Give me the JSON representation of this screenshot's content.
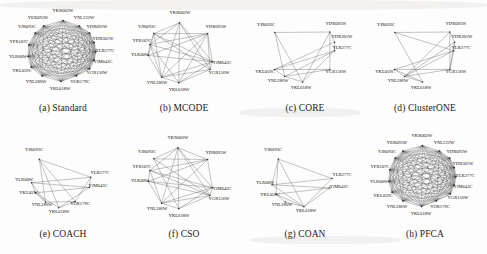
{
  "figure": {
    "type": "scientific-figure",
    "panel_count": 8,
    "columns": 4,
    "rows": 2,
    "background_color": "#fdfdfd",
    "edge_color": "#4a4a4a",
    "label_color": "#15130f"
  },
  "genes": {
    "full_set": [
      "YKR002W",
      "YER095W",
      "YNL222W",
      "YJR093C",
      "YDR095W",
      "YDR301W",
      "YPR107C",
      "YLR277C",
      "YLR00W",
      "YJM043C",
      "YKL059C",
      "YGR156W",
      "YNL286W",
      "YOR179C",
      "YKL018W"
    ],
    "core_set": [
      "YKR002W",
      "YJR093C",
      "YPR107C",
      "YLR00W",
      "YDR095W",
      "YDR301W",
      "YLR277C",
      "YJM043C",
      "YGR156W",
      "YNL286W",
      "YKL018W"
    ],
    "reduced_set": [
      "YJR093C",
      "YDR095W",
      "YDR301W",
      "YLR277C",
      "YKL059C",
      "YGR156W",
      "YNL286W",
      "YKL018W"
    ],
    "coach_set": [
      "YJR093C",
      "YLR00W",
      "YKL059C",
      "YNL286W",
      "YKL018W",
      "YLR277C",
      "YJM043C",
      "YOR179C"
    ]
  },
  "panels": [
    {
      "id": "a",
      "caption": "(a) Standard",
      "method": "Standard",
      "node_count": 15,
      "edge_density": "very-high",
      "nodes": [
        {
          "label": "YKR002W",
          "x": 61,
          "y": 12,
          "anchor": "middle"
        },
        {
          "label": "YER095W",
          "x": 36,
          "y": 19,
          "anchor": "middle"
        },
        {
          "label": "YNL222W",
          "x": 82,
          "y": 19,
          "anchor": "middle"
        },
        {
          "label": "YJR093C",
          "x": 25,
          "y": 28,
          "anchor": "middle"
        },
        {
          "label": "YDR095W",
          "x": 95,
          "y": 28,
          "anchor": "middle"
        },
        {
          "label": "YDR301W",
          "x": 101,
          "y": 40,
          "anchor": "middle"
        },
        {
          "label": "YPR107C",
          "x": 17,
          "y": 43,
          "anchor": "middle"
        },
        {
          "label": "YLR277C",
          "x": 103,
          "y": 52,
          "anchor": "middle"
        },
        {
          "label": "YLR00W",
          "x": 16,
          "y": 58,
          "anchor": "middle"
        },
        {
          "label": "YJM043C",
          "x": 101,
          "y": 63,
          "anchor": "middle"
        },
        {
          "label": "YKL059C",
          "x": 20,
          "y": 72,
          "anchor": "middle"
        },
        {
          "label": "YGR156W",
          "x": 95,
          "y": 74,
          "anchor": "middle"
        },
        {
          "label": "YNL286W",
          "x": 34,
          "y": 83,
          "anchor": "middle"
        },
        {
          "label": "YOR179C",
          "x": 78,
          "y": 83,
          "anchor": "middle"
        },
        {
          "label": "YKL018W",
          "x": 58,
          "y": 90,
          "anchor": "middle"
        }
      ]
    },
    {
      "id": "b",
      "caption": "(b) MCODE",
      "method": "MCODE",
      "node_count": 11,
      "edge_density": "high",
      "nodes": [
        {
          "label": "YKR002W",
          "x": 57,
          "y": 14,
          "anchor": "middle"
        },
        {
          "label": "YJR093C",
          "x": 24,
          "y": 28,
          "anchor": "middle"
        },
        {
          "label": "YDR095W",
          "x": 93,
          "y": 28,
          "anchor": "middle"
        },
        {
          "label": "YPR107C",
          "x": 19,
          "y": 42,
          "anchor": "middle"
        },
        {
          "label": "YLR00W",
          "x": 17,
          "y": 56,
          "anchor": "middle"
        },
        {
          "label": "YJM043C",
          "x": 99,
          "y": 64,
          "anchor": "middle"
        },
        {
          "label": "YGR156W",
          "x": 96,
          "y": 74,
          "anchor": "middle"
        },
        {
          "label": "YNL286W",
          "x": 34,
          "y": 84,
          "anchor": "middle"
        },
        {
          "label": "YKL018W",
          "x": 56,
          "y": 91,
          "anchor": "middle"
        }
      ]
    },
    {
      "id": "c",
      "caption": "(c) CORE",
      "method": "CORE",
      "node_count": 8,
      "edge_density": "medium",
      "nodes": [
        {
          "label": "YJR093C",
          "x": 22,
          "y": 26,
          "anchor": "middle"
        },
        {
          "label": "YDR095W",
          "x": 92,
          "y": 25,
          "anchor": "middle"
        },
        {
          "label": "YDR301W",
          "x": 98,
          "y": 38,
          "anchor": "middle"
        },
        {
          "label": "YLR277C",
          "x": 98,
          "y": 49,
          "anchor": "middle"
        },
        {
          "label": "YKL059C",
          "x": 21,
          "y": 73,
          "anchor": "middle"
        },
        {
          "label": "YGR156W",
          "x": 92,
          "y": 73,
          "anchor": "middle"
        },
        {
          "label": "YNL286W",
          "x": 34,
          "y": 82,
          "anchor": "middle"
        },
        {
          "label": "YKL018W",
          "x": 57,
          "y": 89,
          "anchor": "middle"
        }
      ]
    },
    {
      "id": "d",
      "caption": "(d) ClusterONE",
      "method": "ClusterONE",
      "node_count": 8,
      "edge_density": "medium",
      "nodes": [
        {
          "label": "YJR093C",
          "x": 22,
          "y": 26,
          "anchor": "middle"
        },
        {
          "label": "YDR095W",
          "x": 92,
          "y": 25,
          "anchor": "middle"
        },
        {
          "label": "YDR301W",
          "x": 98,
          "y": 38,
          "anchor": "middle"
        },
        {
          "label": "YLR277C",
          "x": 97,
          "y": 49,
          "anchor": "middle"
        },
        {
          "label": "YKL059C",
          "x": 21,
          "y": 73,
          "anchor": "middle"
        },
        {
          "label": "YGR156W",
          "x": 92,
          "y": 73,
          "anchor": "middle"
        },
        {
          "label": "YNL286W",
          "x": 34,
          "y": 82,
          "anchor": "middle"
        },
        {
          "label": "YKL018W",
          "x": 57,
          "y": 89,
          "anchor": "middle"
        }
      ]
    },
    {
      "id": "e",
      "caption": "(e) COACH",
      "method": "COACH",
      "node_count": 8,
      "edge_density": "low",
      "nodes": [
        {
          "label": "YJR093C",
          "x": 32,
          "y": 25,
          "anchor": "middle"
        },
        {
          "label": "YLR277C",
          "x": 98,
          "y": 48,
          "anchor": "middle"
        },
        {
          "label": "YLR00W",
          "x": 22,
          "y": 55,
          "anchor": "middle"
        },
        {
          "label": "YJM043C",
          "x": 96,
          "y": 61,
          "anchor": "middle"
        },
        {
          "label": "YKL059C",
          "x": 27,
          "y": 68,
          "anchor": "middle"
        },
        {
          "label": "YNL286W",
          "x": 40,
          "y": 80,
          "anchor": "middle"
        },
        {
          "label": "YOR179C",
          "x": 78,
          "y": 79,
          "anchor": "middle"
        },
        {
          "label": "YKL018W",
          "x": 57,
          "y": 87,
          "anchor": "middle"
        }
      ]
    },
    {
      "id": "f",
      "caption": "(f) CSO",
      "method": "CSO",
      "node_count": 11,
      "edge_density": "high",
      "nodes": [
        {
          "label": "YKR002W",
          "x": 55,
          "y": 13,
          "anchor": "middle"
        },
        {
          "label": "YJR093C",
          "x": 24,
          "y": 27,
          "anchor": "middle"
        },
        {
          "label": "YDR095W",
          "x": 93,
          "y": 28,
          "anchor": "middle"
        },
        {
          "label": "YPR107C",
          "x": 19,
          "y": 42,
          "anchor": "middle"
        },
        {
          "label": "YLR00W",
          "x": 17,
          "y": 56,
          "anchor": "middle"
        },
        {
          "label": "YJM043C",
          "x": 99,
          "y": 64,
          "anchor": "middle"
        },
        {
          "label": "YGR156W",
          "x": 96,
          "y": 74,
          "anchor": "middle"
        },
        {
          "label": "YNL286W",
          "x": 34,
          "y": 84,
          "anchor": "middle"
        },
        {
          "label": "YKL018W",
          "x": 56,
          "y": 91,
          "anchor": "middle"
        }
      ]
    },
    {
      "id": "g",
      "caption": "(g) COAN",
      "method": "COAN",
      "node_count": 7,
      "edge_density": "low",
      "nodes": [
        {
          "label": "YJR093C",
          "x": 29,
          "y": 25,
          "anchor": "middle"
        },
        {
          "label": "YLR277C",
          "x": 98,
          "y": 50,
          "anchor": "middle"
        },
        {
          "label": "YLR00W",
          "x": 21,
          "y": 58,
          "anchor": "middle"
        },
        {
          "label": "YJM043C",
          "x": 95,
          "y": 62,
          "anchor": "middle"
        },
        {
          "label": "YKL059C",
          "x": 26,
          "y": 70,
          "anchor": "middle"
        },
        {
          "label": "YNL286W",
          "x": 38,
          "y": 80,
          "anchor": "middle"
        },
        {
          "label": "YKL018W",
          "x": 62,
          "y": 86,
          "anchor": "middle"
        }
      ]
    },
    {
      "id": "h",
      "caption": "(h) PFCA",
      "method": "PFCA",
      "node_count": 15,
      "edge_density": "very-high",
      "nodes": [
        {
          "label": "YKR002W",
          "x": 58,
          "y": 11,
          "anchor": "middle"
        },
        {
          "label": "YER095W",
          "x": 33,
          "y": 18,
          "anchor": "middle"
        },
        {
          "label": "YNL222W",
          "x": 80,
          "y": 18,
          "anchor": "middle"
        },
        {
          "label": "YJR093C",
          "x": 23,
          "y": 27,
          "anchor": "middle"
        },
        {
          "label": "YDR095W",
          "x": 93,
          "y": 27,
          "anchor": "middle"
        },
        {
          "label": "YDR301W",
          "x": 99,
          "y": 39,
          "anchor": "middle"
        },
        {
          "label": "YPR107C",
          "x": 16,
          "y": 42,
          "anchor": "middle"
        },
        {
          "label": "YLR277C",
          "x": 101,
          "y": 51,
          "anchor": "middle"
        },
        {
          "label": "YLR00W",
          "x": 15,
          "y": 57,
          "anchor": "middle"
        },
        {
          "label": "YJM043C",
          "x": 99,
          "y": 62,
          "anchor": "middle"
        },
        {
          "label": "YKL059C",
          "x": 19,
          "y": 71,
          "anchor": "middle"
        },
        {
          "label": "YGR156W",
          "x": 94,
          "y": 73,
          "anchor": "middle"
        },
        {
          "label": "YNL286W",
          "x": 33,
          "y": 82,
          "anchor": "middle"
        },
        {
          "label": "YOR179C",
          "x": 76,
          "y": 82,
          "anchor": "middle"
        },
        {
          "label": "YKL018W",
          "x": 57,
          "y": 89,
          "anchor": "middle"
        }
      ]
    }
  ]
}
